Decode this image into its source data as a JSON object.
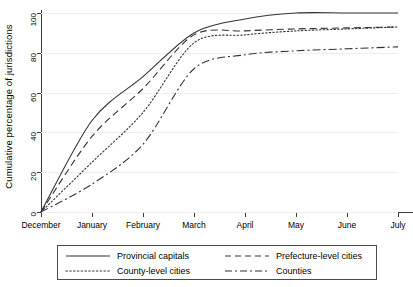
{
  "chart_data": {
    "type": "line",
    "title": "",
    "subtitle": "",
    "xlabel": "",
    "ylabel": "Cumulative percentage of jurisdictions",
    "x": [
      "December",
      "January",
      "February",
      "March",
      "April",
      "May",
      "June",
      "July"
    ],
    "xtick_labels": [
      "December",
      "January",
      "February",
      "March",
      "April",
      "May",
      "June",
      "July"
    ],
    "ytick_labels": [
      "0",
      "20",
      "40",
      "60",
      "80",
      "100"
    ],
    "ytick_values": [
      0,
      20,
      40,
      60,
      80,
      100
    ],
    "ylim": [
      0,
      100
    ],
    "grid": "horizontal",
    "legend_position": "below-axis",
    "series": [
      {
        "name": "Provincial capitals",
        "style": "solid",
        "values": [
          0,
          46,
          68,
          90,
          97,
          100,
          100,
          100
        ]
      },
      {
        "name": "Prefecture-level cities",
        "style": "dashed",
        "values": [
          0,
          38,
          62,
          89,
          91,
          92,
          92.5,
          93
        ]
      },
      {
        "name": "County-level cities",
        "style": "dotted",
        "values": [
          0,
          25,
          50,
          85,
          89,
          91,
          92,
          93
        ]
      },
      {
        "name": "Counties",
        "style": "dash-dot",
        "values": [
          0,
          14,
          34,
          72,
          79,
          81,
          82,
          83
        ]
      }
    ]
  },
  "legend": {
    "entries": [
      {
        "label": "Provincial capitals",
        "icon": "solid-line-icon"
      },
      {
        "label": "Prefecture-level cities",
        "icon": "dashed-line-icon"
      },
      {
        "label": "County-level cities",
        "icon": "dotted-line-icon"
      },
      {
        "label": "Counties",
        "icon": "dash-dot-line-icon"
      }
    ]
  },
  "colors": {
    "line": "#333333",
    "axis": "#3a3a3a",
    "grid": "#eceded",
    "background": "#ffffff"
  }
}
